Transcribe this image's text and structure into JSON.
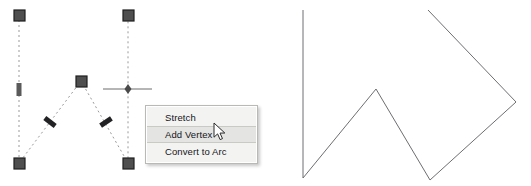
{
  "app": {
    "background_color": "#ffffff",
    "panels": [
      "left-editing-panel",
      "right-result-panel"
    ]
  },
  "context_menu": {
    "position": {
      "x": 145,
      "y": 105
    },
    "background_color": "#f3f3f1",
    "border_color": "#b9b9b5",
    "highlight_color": "#e4e4e2",
    "items": [
      {
        "label": "Stretch",
        "selected": false
      },
      {
        "label": "Add Vertex",
        "selected": true
      },
      {
        "label": "Convert to Arc",
        "selected": false
      }
    ]
  },
  "cursor": {
    "type": "arrow-pointer",
    "position": {
      "x": 213,
      "y": 122
    }
  },
  "left_drawing": {
    "description": "selected polyline with grips and dashed preview",
    "line_color": "#8a8a8a",
    "grip_fill": "#5a5a5a",
    "grip_border": "#2b2b2b",
    "dash_pattern": "2 3",
    "polyline_points": "19,15 19,163 81,81 128,163 128,15",
    "vertex_grips": [
      {
        "x": 19,
        "y": 15,
        "shape": "square"
      },
      {
        "x": 81,
        "y": 81,
        "shape": "square"
      },
      {
        "x": 19,
        "y": 163,
        "shape": "square"
      },
      {
        "x": 128,
        "y": 163,
        "shape": "square"
      },
      {
        "x": 128,
        "y": 15,
        "shape": "square"
      }
    ],
    "midpoint_grips": [
      {
        "x": 19,
        "y": 90,
        "angle": 90
      },
      {
        "x": 50,
        "y": 122,
        "angle": 53
      },
      {
        "x": 105,
        "y": 122,
        "angle": -60
      },
      {
        "x": 128,
        "y": 89,
        "angle": 90
      }
    ],
    "crosshair": {
      "x": 128,
      "y": 89,
      "x1": 103,
      "x2": 152,
      "color": "#6d6d6d"
    }
  },
  "right_drawing": {
    "description": "resulting polyline after adding a vertex",
    "line_color": "#6e6e72",
    "polyline_points": "303,10 303,178 376,89 430,180 516,102 428,10"
  }
}
